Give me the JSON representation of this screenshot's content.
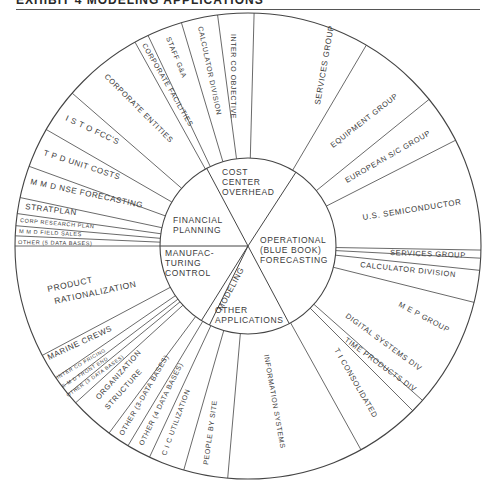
{
  "header": {
    "title": "EXHIBIT 4 MODELING APPLICATIONS"
  },
  "diagram": {
    "center": [
      248,
      246
    ],
    "outer_radius": 233,
    "inner_radius": 88,
    "line_color": "#444444",
    "core_sectors": [
      {
        "label_lines": [
          "COST",
          "CENTER",
          "OVERHEAD"
        ],
        "x": 222,
        "y": 175,
        "anchor": "start"
      },
      {
        "label_lines": [
          "FINANCIAL",
          "PLANNING"
        ],
        "x": 173,
        "y": 223,
        "anchor": "start"
      },
      {
        "label_lines": [
          "OPERATIONAL",
          "(BLUE BOOK)",
          "FORECASTING"
        ],
        "x": 260,
        "y": 243,
        "anchor": "start"
      },
      {
        "label_lines": [
          "MANUFAC-",
          "TURING",
          "CONTROL"
        ],
        "x": 165,
        "y": 256,
        "anchor": "start"
      },
      {
        "label_lines": [
          "OTHER",
          "APPLICATIONS"
        ],
        "x": 215,
        "y": 313,
        "anchor": "start"
      }
    ],
    "modeling_label": {
      "text": "MODELING",
      "x": 222,
      "y": 311,
      "rotate": -62
    },
    "core_lines": [
      {
        "from_angle": -118,
        "to_angle": 62,
        "through_center": true
      },
      {
        "angle": -57
      },
      {
        "angle": 180
      },
      {
        "angle": 122
      },
      {
        "angle": 116
      }
    ],
    "spokes": [
      -88.5,
      -97.5,
      -106.6,
      -115.4,
      -119,
      -139,
      -150,
      -160,
      -168,
      -172,
      -175,
      -177.5,
      180,
      152,
      145.6,
      142.8,
      140.6,
      137.7,
      126.6,
      121,
      115,
      106,
      95,
      61,
      45,
      41.5,
      14,
      6,
      3,
      1,
      -27,
      -39,
      -59.5
    ],
    "segments": [
      {
        "label": "SERVICES GROUP",
        "x": 320,
        "y": 105,
        "rotate": -80,
        "size": 8
      },
      {
        "label": "INTER CO OBJECTIVE",
        "x": 231,
        "y": 34,
        "rotate": 90,
        "size": 7
      },
      {
        "label": "CALCULATOR DIVISION",
        "x": 198,
        "y": 27,
        "rotate": 78,
        "size": 7
      },
      {
        "label": "STAFF G&A",
        "x": 166,
        "y": 38,
        "rotate": 68,
        "size": 7
      },
      {
        "label": "CORPORATE FACILITIES",
        "x": 142,
        "y": 45,
        "rotate": 60,
        "size": 7
      },
      {
        "label": "CORPORATE ENTITIES",
        "x": 104,
        "y": 77,
        "rotate": 45,
        "size": 7.5
      },
      {
        "label": "I S T O FCC'S",
        "x": 65,
        "y": 120,
        "rotate": 25,
        "size": 8
      },
      {
        "label": "T P D UNIT COSTS",
        "x": 43,
        "y": 155,
        "rotate": 18,
        "size": 8
      },
      {
        "label": "M M D NSE FORECASTING",
        "x": 30,
        "y": 184,
        "rotate": 12,
        "size": 8
      },
      {
        "label": "STRATPLAN",
        "x": 25,
        "y": 209,
        "rotate": 7,
        "size": 8
      },
      {
        "label": "CORP RESEARCH PLAN",
        "x": 20,
        "y": 222,
        "rotate": 5,
        "size": 5.5
      },
      {
        "label": "M M D FIELD SALES",
        "x": 19,
        "y": 233,
        "rotate": 3,
        "size": 5.5
      },
      {
        "label": "OTHER (5 DATA BASES)",
        "x": 18,
        "y": 244,
        "rotate": 1,
        "size": 5.5
      },
      {
        "label": "PRODUCT",
        "x": 48,
        "y": 292,
        "rotate": -12,
        "size": 8.5
      },
      {
        "label": "RATIONALIZATION",
        "x": 55,
        "y": 304,
        "rotate": -12,
        "size": 8.5
      },
      {
        "label": "MARINE CREWS",
        "x": 49,
        "y": 360,
        "rotate": -25,
        "size": 8
      },
      {
        "label": "INTER CO PRICING",
        "x": 58,
        "y": 379,
        "rotate": -30,
        "size": 5
      },
      {
        "label": "C M D FRONT END",
        "x": 63,
        "y": 388,
        "rotate": -32,
        "size": 5
      },
      {
        "label": "OTHER (3 DATA BASES)",
        "x": 68,
        "y": 397,
        "rotate": -35,
        "size": 5
      },
      {
        "label": "ORGANIZATION",
        "x": 99,
        "y": 400,
        "rotate": -48,
        "size": 7.5
      },
      {
        "label": "STRUCTURE",
        "x": 108,
        "y": 410,
        "rotate": -48,
        "size": 7.5
      },
      {
        "label": "OTHER (3-DATA BASES)",
        "x": 123,
        "y": 436,
        "rotate": -60,
        "size": 7
      },
      {
        "label": "OTHER (4 DATA BASES)",
        "x": 143,
        "y": 446,
        "rotate": -64,
        "size": 7
      },
      {
        "label": "C I C UTILIZATION",
        "x": 166,
        "y": 456,
        "rotate": -70,
        "size": 7
      },
      {
        "label": "PEOPLE BY SITE",
        "x": 208,
        "y": 465,
        "rotate": -82,
        "size": 7
      },
      {
        "label": "INFORMATION SYSTEMS",
        "x": 264,
        "y": 355,
        "rotate": 80,
        "size": 7
      },
      {
        "label": "T I CONSOLIDATED",
        "x": 334,
        "y": 350,
        "rotate": 60,
        "size": 7.5
      },
      {
        "label": "TIME PRODUCTS DIV",
        "x": 344,
        "y": 341,
        "rotate": 36,
        "size": 7.5
      },
      {
        "label": "DIGITAL SYSTEMS DIV",
        "x": 345,
        "y": 317,
        "rotate": 36,
        "size": 7.5
      },
      {
        "label": "M E P GROUP",
        "x": 398,
        "y": 306,
        "rotate": 28,
        "size": 7.5
      },
      {
        "label": "CALCULATOR DIVISION",
        "x": 360,
        "y": 267,
        "rotate": 6,
        "size": 7.5
      },
      {
        "label": "SERVICES GROUP",
        "x": 390,
        "y": 255,
        "rotate": 2,
        "size": 7.5
      },
      {
        "label": "U.S. SEMICONDUCTOR",
        "x": 363,
        "y": 220,
        "rotate": -9,
        "size": 8
      },
      {
        "label": "EUROPEAN S/C GROUP",
        "x": 347,
        "y": 183,
        "rotate": -30,
        "size": 7.5
      },
      {
        "label": "EQUIPMENT GROUP",
        "x": 333,
        "y": 148,
        "rotate": -38,
        "size": 7.5
      }
    ]
  }
}
